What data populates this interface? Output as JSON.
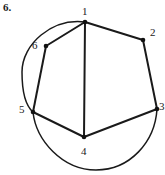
{
  "figure": {
    "problem_number": "6.",
    "stroke_color": "#1a1a1a",
    "background_color": "#ffffff",
    "vertex_dot_color": "#111111"
  },
  "vertices": [
    {
      "label": "1",
      "x": 85,
      "y": 22,
      "label_x": 82,
      "label_y": 6,
      "name": "vertex-1"
    },
    {
      "label": "2",
      "x": 143,
      "y": 40,
      "label_x": 150,
      "label_y": 27,
      "name": "vertex-2"
    },
    {
      "label": "3",
      "x": 157,
      "y": 109,
      "label_x": 159,
      "label_y": 101,
      "name": "vertex-3"
    },
    {
      "label": "4",
      "x": 84,
      "y": 137,
      "label_x": 81,
      "label_y": 146,
      "name": "vertex-4"
    },
    {
      "label": "5",
      "x": 33,
      "y": 112,
      "label_x": 19,
      "label_y": 104,
      "name": "vertex-5"
    },
    {
      "label": "6",
      "x": 46,
      "y": 46,
      "label_x": 32,
      "label_y": 40,
      "name": "vertex-6"
    }
  ],
  "chords": [
    {
      "name": "chord-1-2",
      "from": "1",
      "to": "2"
    },
    {
      "name": "chord-2-3",
      "from": "2",
      "to": "3"
    },
    {
      "name": "chord-3-4",
      "from": "3",
      "to": "4"
    },
    {
      "name": "chord-4-5",
      "from": "4",
      "to": "5"
    },
    {
      "name": "chord-5-6",
      "from": "5",
      "to": "6"
    },
    {
      "name": "chord-6-1",
      "from": "6",
      "to": "1"
    },
    {
      "name": "chord-1-4",
      "from": "1",
      "to": "4"
    }
  ],
  "arcs": [
    {
      "name": "upper-left-arc",
      "description": "circle arc from vertex 1 counterclockwise past vertex 6 down to vertex 5",
      "path": "M 85 22 C 52 18 22 44 22 72 C 22 94 26 106 33 112"
    },
    {
      "name": "lower-arc",
      "description": "circle arc from vertex 5 down under vertex 4 and up to vertex 3",
      "path": "M 33 112 C 36 140 62 170 96 170 C 130 170 155 142 157 109"
    }
  ]
}
